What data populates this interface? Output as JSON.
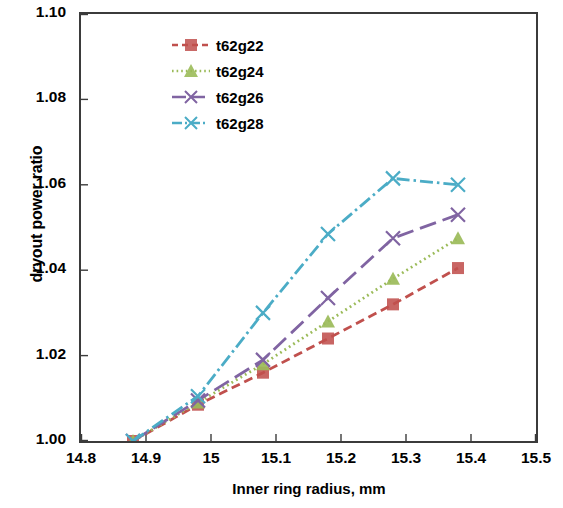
{
  "chart_data": {
    "type": "line",
    "title": "",
    "xlabel": "Inner ring radius, mm",
    "ylabel": "dryout power ratio",
    "xlim": [
      14.8,
      15.5
    ],
    "ylim": [
      1.0,
      1.1
    ],
    "xticks": [
      "14.8",
      "14.9",
      "15",
      "15.1",
      "15.2",
      "15.3",
      "15.4",
      "15.5"
    ],
    "yticks": [
      "1.00",
      "1.02",
      "1.04",
      "1.06",
      "1.08",
      "1.10"
    ],
    "grid": false,
    "legend_position": "top-left",
    "x": [
      14.88,
      14.98,
      15.08,
      15.18,
      15.28,
      15.38
    ],
    "series": [
      {
        "name": "t62g22",
        "color": "#c0504d",
        "marker": "square",
        "dash": "dashed",
        "values": [
          1.0,
          1.0085,
          1.016,
          1.024,
          1.032,
          1.0405
        ]
      },
      {
        "name": "t62g24",
        "color": "#9bbb59",
        "marker": "triangle",
        "dash": "dotted",
        "values": [
          1.0,
          1.009,
          1.018,
          1.028,
          1.038,
          1.0475
        ]
      },
      {
        "name": "t62g26",
        "color": "#8064a2",
        "marker": "x",
        "dash": "long-dash",
        "values": [
          1.0,
          1.0095,
          1.019,
          1.0335,
          1.0475,
          1.053
        ]
      },
      {
        "name": "t62g28",
        "color": "#4bacc6",
        "marker": "x",
        "dash": "dash-dot",
        "values": [
          1.0,
          1.0105,
          1.03,
          1.0485,
          1.0615,
          1.06
        ]
      }
    ]
  },
  "legend": {
    "items": [
      {
        "label": "t62g22"
      },
      {
        "label": "t62g24"
      },
      {
        "label": "t62g26"
      },
      {
        "label": "t62g28"
      }
    ]
  }
}
